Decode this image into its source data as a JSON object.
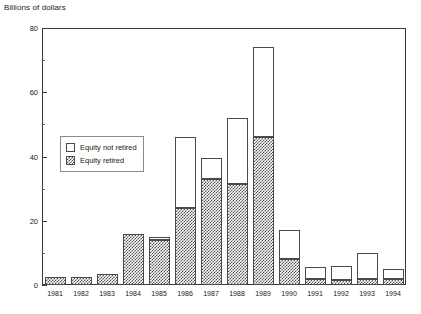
{
  "chart_data": {
    "type": "bar",
    "title": "Billions of dollars",
    "subtitle": "",
    "xlabel": "",
    "ylabel": "Billions of dollars",
    "ylim": [
      0,
      80
    ],
    "yticks": [
      0,
      20,
      40,
      60,
      80
    ],
    "ytick_labels": [
      "0",
      "20",
      "40",
      "60",
      "80"
    ],
    "yminor_ticks": [
      10,
      30,
      50,
      70
    ],
    "grid": false,
    "stacked": true,
    "legend_position": "upper-left-inside",
    "categories": [
      "1981",
      "1982",
      "1983",
      "1984",
      "1985",
      "1986",
      "1987",
      "1988",
      "1989",
      "1990",
      "1991",
      "1992",
      "1993",
      "1994"
    ],
    "series": [
      {
        "name": "Equity retired",
        "fill": "cross-hatch",
        "values": [
          2.5,
          2.5,
          3.5,
          16,
          14,
          24,
          33,
          31.5,
          46,
          8,
          2,
          1.5,
          2,
          2
        ]
      },
      {
        "name": "Equity not retired",
        "fill": "white",
        "values": [
          0,
          0,
          0,
          0,
          1,
          22,
          6.5,
          20.5,
          28,
          9,
          3.5,
          4.5,
          8,
          3
        ]
      }
    ],
    "totals": [
      2.5,
      2.5,
      3.5,
      16,
      15,
      46,
      39.5,
      52,
      74,
      17,
      5.5,
      6,
      10,
      5
    ]
  },
  "legend": {
    "entries": [
      {
        "label": "Equity not retired",
        "swatch": "white"
      },
      {
        "label": "Equity retired",
        "swatch": "hatched"
      }
    ]
  }
}
